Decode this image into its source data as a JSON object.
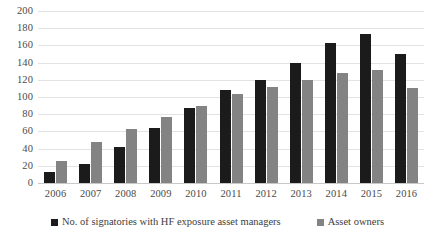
{
  "chart_data": {
    "type": "bar",
    "title": "",
    "subtitle": "",
    "xlabel": "",
    "ylabel": "",
    "ylim": [
      0,
      200
    ],
    "ytick_step": 20,
    "yticks": [
      200,
      180,
      160,
      140,
      120,
      100,
      80,
      60,
      40,
      20,
      0
    ],
    "grid": true,
    "legend_position": "bottom",
    "categories": [
      "2006",
      "2007",
      "2008",
      "2009",
      "2010",
      "2011",
      "2012",
      "2013",
      "2014",
      "2015",
      "2016"
    ],
    "series": [
      {
        "name": "No. of signatories with HF exposure asset managers",
        "color": "#1b1b1b",
        "values": [
          13,
          22,
          42,
          64,
          87,
          108,
          120,
          140,
          163,
          173,
          150
        ]
      },
      {
        "name": "Asset owners",
        "color": "#838383",
        "values": [
          26,
          48,
          63,
          77,
          90,
          103,
          112,
          120,
          128,
          131,
          110
        ]
      }
    ]
  },
  "colors": {
    "series_a": "#1b1b1b",
    "series_b": "#838383",
    "gridline": "#e3e3e3",
    "axis": "#c8c8c8",
    "text": "#4a4a4a",
    "background": "#ffffff"
  }
}
